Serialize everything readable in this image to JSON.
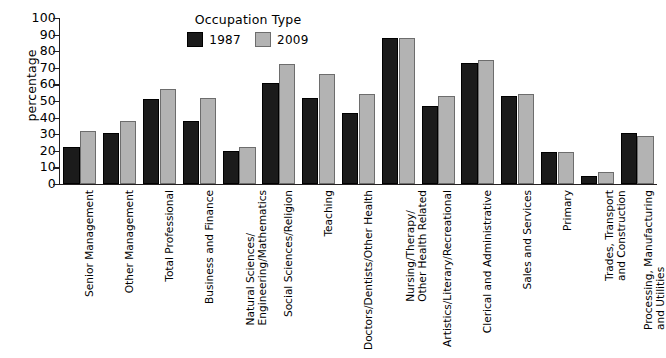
{
  "chart_data": {
    "type": "bar",
    "title": "",
    "xlabel": "",
    "ylabel": "percentage",
    "ylim": [
      0,
      100
    ],
    "ytick_step": 10,
    "grid": false,
    "legend_title": "Occupation Type",
    "legend_position": "top-center",
    "categories": [
      "Senior Management",
      "Other Management",
      "Total Professional",
      "Business and Finance",
      "Natural Sciences/\nEngineering/Mathematics",
      "Social Sciences/Religion",
      "Teaching",
      "Doctors/Dentists/Other Health",
      "Nursing/Therapy/\nOther Health Related",
      "Artistics/Literary/Recreational",
      "Clerical and Administrative",
      "Sales and Services",
      "Primary",
      "Trades, Transport\nand Construction",
      "Processing, Manufacturing\nand Utilities"
    ],
    "ytick_labels": [
      "100",
      "90",
      "80",
      "70",
      "60",
      "50",
      "40",
      "30",
      "20",
      "10",
      "0"
    ],
    "series": [
      {
        "name": "1987",
        "color": "#1b1b1b",
        "values": [
          22,
          31,
          51,
          38,
          20,
          61,
          52,
          43,
          88,
          47,
          73,
          53,
          19,
          5,
          31
        ]
      },
      {
        "name": "2009",
        "color": "#b3b3b3",
        "values": [
          32,
          38,
          57,
          52,
          22,
          72,
          66,
          54,
          88,
          53,
          75,
          54,
          19,
          7,
          29
        ]
      }
    ]
  }
}
